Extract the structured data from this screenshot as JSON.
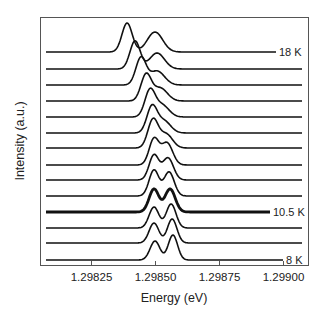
{
  "chart_data": {
    "type": "line",
    "title": "",
    "xlabel": "Energy (eV)",
    "ylabel": "Intensity (a.u.)",
    "xlim": [
      1.29805,
      1.2991
    ],
    "x_ticks": [
      1.29825,
      1.2985,
      1.29875,
      1.299
    ],
    "x_tick_labels": [
      "1.29825",
      "1.29850",
      "1.29875",
      "1.29900"
    ],
    "y_ticks": [],
    "grid": false,
    "legend": "none; inline labels at right of selected curves",
    "offset_stacked": true,
    "annotations": [
      {
        "text": "18 K",
        "curve_index": 0
      },
      {
        "text": "10.5 K",
        "curve_index": 10
      },
      {
        "text": "8 K",
        "curve_index": 13
      }
    ],
    "series": [
      {
        "name": "18 K",
        "label": "18 K",
        "offset": 13,
        "thick": false,
        "peaks": [
          {
            "energy": 1.298391,
            "height": 29,
            "width": 2e-05
          },
          {
            "energy": 1.2985,
            "height": 20,
            "width": 3e-05
          }
        ]
      },
      {
        "name": "curve 2",
        "label": "",
        "offset": 12,
        "thick": false,
        "peaks": [
          {
            "energy": 1.298422,
            "height": 28,
            "width": 2e-05
          },
          {
            "energy": 1.298508,
            "height": 16,
            "width": 2.9e-05
          }
        ]
      },
      {
        "name": "curve 3",
        "label": "",
        "offset": 11,
        "thick": false,
        "peaks": [
          {
            "energy": 1.298445,
            "height": 27,
            "width": 2e-05
          },
          {
            "energy": 1.298508,
            "height": 14,
            "width": 2.9e-05
          }
        ]
      },
      {
        "name": "curve 4",
        "label": "",
        "offset": 10,
        "thick": false,
        "peaks": [
          {
            "energy": 1.298465,
            "height": 26,
            "width": 2e-05
          },
          {
            "energy": 1.29852,
            "height": 13,
            "width": 2.8e-05
          }
        ]
      },
      {
        "name": "curve 5",
        "label": "",
        "offset": 9,
        "thick": false,
        "peaks": [
          {
            "energy": 1.29848,
            "height": 26,
            "width": 2e-05
          },
          {
            "energy": 1.298527,
            "height": 12,
            "width": 2.7e-05
          }
        ]
      },
      {
        "name": "curve 6",
        "label": "",
        "offset": 8,
        "thick": false,
        "peaks": [
          {
            "energy": 1.298488,
            "height": 26,
            "width": 2e-05
          },
          {
            "energy": 1.298535,
            "height": 12,
            "width": 2.6e-05
          }
        ]
      },
      {
        "name": "curve 7",
        "label": "",
        "offset": 7,
        "thick": false,
        "peaks": [
          {
            "energy": 1.298492,
            "height": 28,
            "width": 2e-05
          },
          {
            "energy": 1.298543,
            "height": 14,
            "width": 2.5e-05
          }
        ]
      },
      {
        "name": "curve 8",
        "label": "",
        "offset": 6,
        "thick": false,
        "peaks": [
          {
            "energy": 1.298496,
            "height": 26,
            "width": 1.9e-05
          },
          {
            "energy": 1.298547,
            "height": 22,
            "width": 2.2e-05
          }
        ]
      },
      {
        "name": "curve 9",
        "label": "",
        "offset": 5,
        "thick": false,
        "peaks": [
          {
            "energy": 1.298496,
            "height": 25,
            "width": 1.9e-05
          },
          {
            "energy": 1.298551,
            "height": 22,
            "width": 2.1e-05
          }
        ]
      },
      {
        "name": "curve 10",
        "label": "",
        "offset": 4,
        "thick": false,
        "peaks": [
          {
            "energy": 1.298496,
            "height": 26,
            "width": 1.9e-05
          },
          {
            "energy": 1.298555,
            "height": 24,
            "width": 2e-05
          }
        ]
      },
      {
        "name": "10.5 K",
        "label": "10.5 K",
        "offset": 3,
        "thick": true,
        "peaks": [
          {
            "energy": 1.298496,
            "height": 23,
            "width": 1.9e-05
          },
          {
            "energy": 1.298559,
            "height": 23,
            "width": 2e-05
          }
        ]
      },
      {
        "name": "curve 12",
        "label": "",
        "offset": 2,
        "thick": false,
        "peaks": [
          {
            "energy": 1.298496,
            "height": 21,
            "width": 1.9e-05
          },
          {
            "energy": 1.298563,
            "height": 24,
            "width": 1.9e-05
          }
        ]
      },
      {
        "name": "curve 13",
        "label": "",
        "offset": 1,
        "thick": false,
        "peaks": [
          {
            "energy": 1.298496,
            "height": 20,
            "width": 1.9e-05
          },
          {
            "energy": 1.298567,
            "height": 24,
            "width": 1.85e-05
          }
        ]
      },
      {
        "name": "8 K",
        "label": "8 K",
        "offset": 0,
        "thick": false,
        "peaks": [
          {
            "energy": 1.2985,
            "height": 19,
            "width": 1.9e-05
          },
          {
            "energy": 1.29857,
            "height": 25,
            "width": 1.8e-05
          }
        ]
      }
    ]
  },
  "layout": {
    "plot_left": 40,
    "plot_right": 309,
    "plot_top": 17,
    "plot_bottom": 266,
    "baselines_px": [
      52,
      69,
      85,
      101,
      117,
      133,
      148,
      165,
      180,
      196,
      212,
      228,
      243,
      260
    ],
    "line_end_px": [
      276,
      302,
      302,
      302,
      302,
      302,
      302,
      302,
      302,
      302,
      270,
      302,
      302,
      283
    ],
    "line_start_px": 46
  }
}
